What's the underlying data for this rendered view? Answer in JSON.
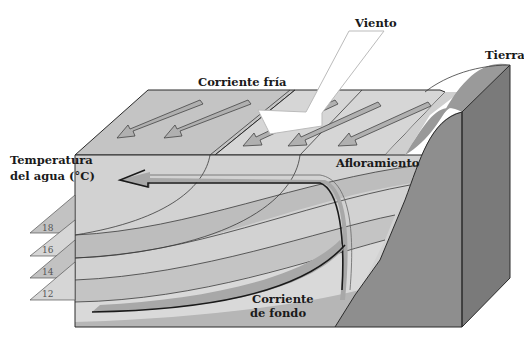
{
  "labels": {
    "wind": "Viento",
    "land": "Tierra",
    "cold_current": "Corriente fría",
    "upwelling": "Afloramiento",
    "water_temp_line1": "Temperatura",
    "water_temp_line2": "del agua (°C)",
    "bottom_current_line1": "Corriente",
    "bottom_current_line2": "de fondo"
  },
  "temperature_layers": [
    {
      "value": "18"
    },
    {
      "value": "16"
    },
    {
      "value": "14"
    },
    {
      "value": "12"
    }
  ],
  "colors": {
    "surface": "#c4c4c4",
    "surface_light": "#d6d6d6",
    "water_front": "#d2d2d2",
    "water_band_dark": "#bdbdbd",
    "water_band_light": "#dedede",
    "land_front": "#8e8e8e",
    "land_side": "#7a7a7a",
    "land_top": "#999999",
    "arrow_fill": "#b0b0b0",
    "wind_arrow": "#ffffff"
  }
}
